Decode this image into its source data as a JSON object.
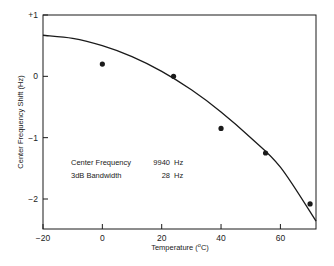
{
  "chart_data": {
    "type": "scatter",
    "title": "",
    "xlabel": "Temperature (°C)",
    "xlabel_parts": {
      "main": "Temperature  (",
      "sup": "o",
      "unit": "C)"
    },
    "ylabel": "Center Frequency Shift (Hz)",
    "xlim": [
      -20,
      72
    ],
    "ylim": [
      -2.5,
      1
    ],
    "xticks": [
      -20,
      0,
      20,
      40,
      60
    ],
    "xtick_labels": [
      "−20",
      "0",
      "20",
      "40",
      "60"
    ],
    "yticks": [
      1,
      0,
      -1,
      -2
    ],
    "ytick_labels": [
      "+1",
      "0",
      "−1",
      "−2"
    ],
    "grid": false,
    "legend": null,
    "series": [
      {
        "name": "Measured",
        "type": "scatter",
        "x": [
          0,
          24,
          40,
          55,
          70
        ],
        "y": [
          0.2,
          0.0,
          -0.85,
          -1.25,
          -2.08
        ]
      },
      {
        "name": "Fitted curve",
        "type": "line",
        "x": [
          -20,
          -10,
          0,
          10,
          20,
          30,
          40,
          50,
          60,
          72
        ],
        "y": [
          0.67,
          0.62,
          0.5,
          0.32,
          0.08,
          -0.22,
          -0.58,
          -1.0,
          -1.48,
          -2.36
        ]
      }
    ],
    "annotations": [
      {
        "label": "Center Frequency",
        "value": "9940",
        "unit": "Hz"
      },
      {
        "label": "3dB Bandwidth",
        "value": "28",
        "unit": "Hz"
      }
    ]
  },
  "colors": {
    "ink": "#1a1a1a",
    "background": "#ffffff"
  }
}
